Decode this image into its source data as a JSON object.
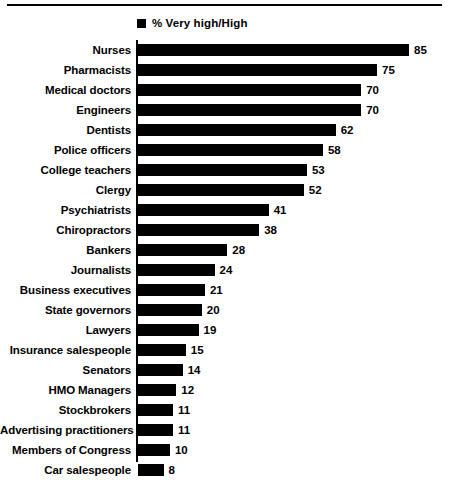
{
  "legend": {
    "marker": "black-square-icon",
    "label": "% Very high/High"
  },
  "chart_data": {
    "type": "bar",
    "orientation": "horizontal",
    "title": "",
    "subtitle": "",
    "xlabel": "",
    "ylabel": "",
    "xlim": [
      0,
      85
    ],
    "grid": false,
    "legend_position": "top-left",
    "legend_entries": [
      "% Very high/High"
    ],
    "categories": [
      "Nurses",
      "Pharmacists",
      "Medical doctors",
      "Engineers",
      "Dentists",
      "Police officers",
      "College teachers",
      "Clergy",
      "Psychiatrists",
      "Chiropractors",
      "Bankers",
      "Journalists",
      "Business executives",
      "State governors",
      "Lawyers",
      "Insurance salespeople",
      "Senators",
      "HMO Managers",
      "Stockbrokers",
      "Advertising practitioners",
      "Members of Congress",
      "Car salespeople"
    ],
    "values": [
      85,
      75,
      70,
      70,
      62,
      58,
      53,
      52,
      41,
      38,
      28,
      24,
      21,
      20,
      19,
      15,
      14,
      12,
      11,
      11,
      10,
      8
    ],
    "series": [
      {
        "name": "% Very high/High",
        "color": "#000000",
        "values": [
          85,
          75,
          70,
          70,
          62,
          58,
          53,
          52,
          41,
          38,
          28,
          24,
          21,
          20,
          19,
          15,
          14,
          12,
          11,
          11,
          10,
          8
        ]
      }
    ]
  },
  "colors": {
    "bar": "#000000",
    "axis": "#000000",
    "background": "#ffffff"
  }
}
